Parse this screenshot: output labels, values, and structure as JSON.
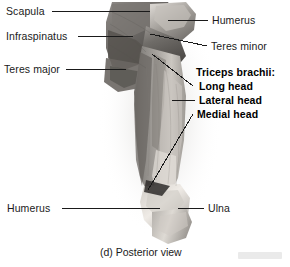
{
  "figure": {
    "caption": "(d) Posterior view",
    "view": "Posterior view",
    "panel_letter": "(d)",
    "background_color": "#ffffff",
    "leader_line_color": "#1a1a1a",
    "specimen_description": "grayscale cadaver photograph of posterior upper limb dissection"
  },
  "labels_left": [
    {
      "id": "scapula",
      "text": "Scapula",
      "bold": false,
      "x": 6,
      "y": 5
    },
    {
      "id": "infraspinatus",
      "text": "Infraspinatus",
      "bold": false,
      "x": 6,
      "y": 30
    },
    {
      "id": "teres-major",
      "text": "Teres major",
      "bold": false,
      "x": 4,
      "y": 63
    },
    {
      "id": "humerus-distal",
      "text": "Humerus",
      "bold": false,
      "x": 7,
      "y": 202
    }
  ],
  "labels_right": [
    {
      "id": "humerus-proximal",
      "text": "Humerus",
      "bold": false,
      "x": 212,
      "y": 14
    },
    {
      "id": "teres-minor",
      "text": "Teres minor",
      "bold": false,
      "x": 211,
      "y": 40
    },
    {
      "id": "triceps-brachii",
      "text": "Triceps brachii:",
      "bold": true,
      "x": 196,
      "y": 66
    },
    {
      "id": "long-head",
      "text": "Long head",
      "bold": true,
      "x": 199,
      "y": 80
    },
    {
      "id": "lateral-head",
      "text": "Lateral head",
      "bold": true,
      "x": 199,
      "y": 94
    },
    {
      "id": "medial-head",
      "text": "Medial head",
      "bold": true,
      "x": 197,
      "y": 108
    },
    {
      "id": "ulna",
      "text": "Ulna",
      "bold": false,
      "x": 208,
      "y": 202
    }
  ],
  "colors": {
    "text": "#1a1a1a",
    "bold_text": "#000000",
    "leader": "#1a1a1a",
    "specimen_dark": "#5a5754",
    "specimen_mid": "#8d8a86",
    "specimen_light": "#cfcbc6",
    "specimen_highlight": "#ece8e3"
  }
}
